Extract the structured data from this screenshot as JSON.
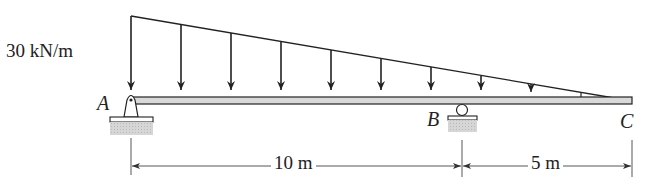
{
  "diagram": {
    "type": "beam-loading",
    "load": {
      "label": "30 kN/m",
      "shape": "triangular",
      "peak_location": "A",
      "zero_location": "C",
      "arrow_count": 10
    },
    "points": {
      "A": {
        "label": "A",
        "support": "pin"
      },
      "B": {
        "label": "B",
        "support": "roller"
      },
      "C": {
        "label": "C",
        "support": "free-end"
      }
    },
    "dimensions": [
      {
        "from": "A",
        "to": "B",
        "label": "10 m"
      },
      {
        "from": "B",
        "to": "C",
        "label": "5 m"
      }
    ],
    "colors": {
      "line": "#222222",
      "beam_fill": "#d9d9d9",
      "ground_fill": "#cfcfcf"
    }
  }
}
